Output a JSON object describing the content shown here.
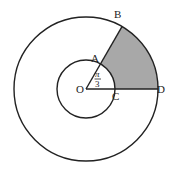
{
  "diagram": {
    "center": {
      "x": 86,
      "y": 89
    },
    "outer_radius": 72,
    "inner_radius": 29,
    "angle_deg": 60,
    "colors": {
      "stroke": "#222222",
      "shade": "#a8a8a8",
      "background": "#ffffff"
    },
    "labels": {
      "O": "O",
      "A": "A",
      "B": "B",
      "C": "C",
      "D": "D",
      "angle_num": "π",
      "angle_den": "3"
    }
  }
}
